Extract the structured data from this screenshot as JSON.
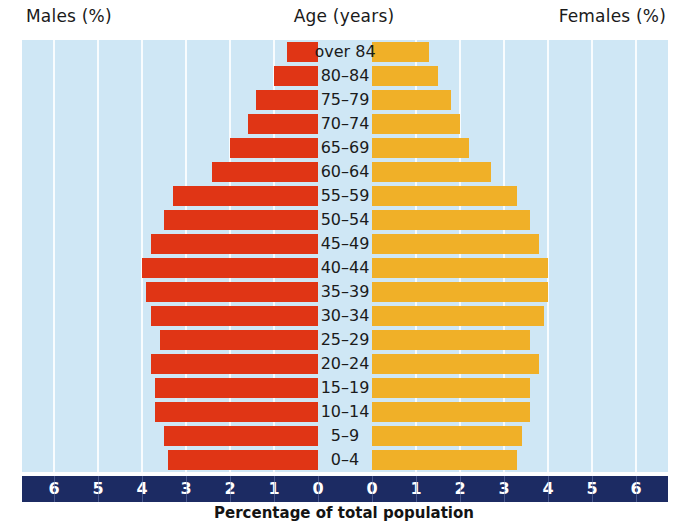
{
  "header": {
    "males_label": "Males (%)",
    "age_label": "Age (years)",
    "females_label": "Females (%)"
  },
  "axis": {
    "title": "Percentage of total population",
    "ticks_left": [
      "6",
      "5",
      "4",
      "3",
      "2",
      "1",
      "0"
    ],
    "ticks_right": [
      "0",
      "1",
      "2",
      "3",
      "4",
      "5",
      "6"
    ]
  },
  "colors": {
    "male_bar": "#e03515",
    "female_bar": "#f0b028",
    "plot_background": "#cfe7f5",
    "axis_strip": "#1c2b63",
    "gridline": "#ffffff",
    "text": "#1b1b1b"
  },
  "chart_data": {
    "type": "bar",
    "subtype": "population-pyramid",
    "title": "",
    "xlabel": "Percentage of total population",
    "ylabel": "Age (years)",
    "xlim": [
      -6,
      6
    ],
    "xtick_values": [
      6,
      5,
      4,
      3,
      2,
      1,
      0,
      0,
      1,
      2,
      3,
      4,
      5,
      6
    ],
    "grid": true,
    "legend_position": "none",
    "categories": [
      "over 84",
      "80–84",
      "75–79",
      "70–74",
      "65–69",
      "60–64",
      "55–59",
      "50–54",
      "45–49",
      "40–44",
      "35–39",
      "30–34",
      "25–29",
      "20–24",
      "15–19",
      "10–14",
      "5–9",
      "0–4"
    ],
    "series": [
      {
        "name": "Males (%)",
        "color": "#e03515",
        "values": [
          0.7,
          1.0,
          1.4,
          1.6,
          2.0,
          2.4,
          3.3,
          3.5,
          3.8,
          4.0,
          3.9,
          3.8,
          3.6,
          3.8,
          3.7,
          3.7,
          3.5,
          3.4
        ]
      },
      {
        "name": "Females (%)",
        "color": "#f0b028",
        "values": [
          1.3,
          1.5,
          1.8,
          2.0,
          2.2,
          2.7,
          3.3,
          3.6,
          3.8,
          4.0,
          4.0,
          3.9,
          3.6,
          3.8,
          3.6,
          3.6,
          3.4,
          3.3
        ]
      }
    ]
  }
}
